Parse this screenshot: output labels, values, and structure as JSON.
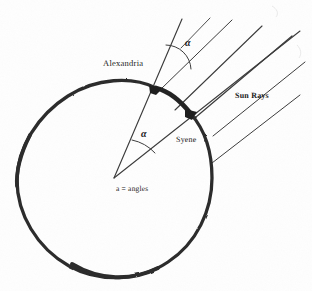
{
  "figure": {
    "background_color": "#fefefe",
    "ink_color": "#2a2a2a",
    "labels": {
      "alexandria": "Alexandria",
      "syene": "Syene",
      "sun_rays": "Sun Rays",
      "caption": "a = angles",
      "alpha_top": "α",
      "alpha_center": "α"
    },
    "geometry": {
      "earth_circle": {
        "center_x": 114,
        "center_y": 178,
        "radius_x": 98,
        "radius_y": 95,
        "stroke_width": 3.2,
        "note": "hand-drawn irregular circle representing the Earth"
      },
      "points": [
        {
          "name": "alexandria",
          "x": 156,
          "y": 88,
          "marker": "thick-blob"
        },
        {
          "name": "syene",
          "x": 191,
          "y": 114,
          "marker": "thick-blob"
        },
        {
          "name": "earth-center",
          "x": 114,
          "y": 178,
          "marker": "vertex"
        }
      ],
      "arc_between_cities": {
        "from": "alexandria",
        "to": "syene",
        "stroke_width": 4.6,
        "note": "darkened arc segment along the rim between the two cities"
      },
      "gnomon_line": {
        "from_x": 114,
        "from_y": 178,
        "to_x": 181,
        "to_y": 18,
        "note": "radius extended through Alexandria to form the vertical gnomon"
      },
      "syene_radius_line": {
        "from_x": 114,
        "from_y": 178,
        "to_x": 300,
        "to_y": 30,
        "note": "radius extended through Syene, parallel to the sun rays"
      },
      "angle_arcs": [
        {
          "name": "alpha-top",
          "cx": 168,
          "cy": 66,
          "radius": 24,
          "note": "angle at Alexandria between gnomon and incoming sun ray"
        },
        {
          "name": "alpha-center",
          "cx": 114,
          "cy": 178,
          "radius": 42,
          "note": "central angle at the Earth's centre between the two radii"
        }
      ],
      "sun_rays": {
        "count": 6,
        "angle_degrees": 45,
        "direction": "from upper-right toward lower-left",
        "note": "parallel rays of sunlight striking the Earth"
      }
    }
  }
}
